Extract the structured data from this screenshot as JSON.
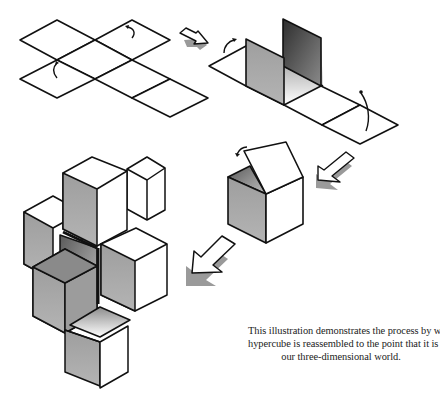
{
  "figure": {
    "stages": [
      {
        "id": "flat-net",
        "label": "Flat net of squares with fold arrows"
      },
      {
        "id": "partially-folded-net",
        "label": "Net with two faces raised"
      },
      {
        "id": "folding-cube",
        "label": "Cube with lid folding closed"
      },
      {
        "id": "assembled-hypercube",
        "label": "Hypercube net of cubes assembled in 3D"
      }
    ],
    "arrows": [
      {
        "from": "flat-net",
        "to": "partially-folded-net",
        "direction": "right-down"
      },
      {
        "from": "partially-folded-net",
        "to": "folding-cube",
        "direction": "left-down"
      },
      {
        "from": "folding-cube",
        "to": "assembled-hypercube",
        "direction": "left-down"
      }
    ],
    "colors": {
      "line": "#111111",
      "face_light": "#ffffff",
      "face_mid": "#a9a9a9",
      "face_dark": "#4a4a4a",
      "arrow_shadow": "#9a9a9a"
    }
  },
  "caption": {
    "lines": [
      "This illustration demonstrates the process by which an unraveled",
      "hypercube is reassembled to the point that it is still visible to",
      "our three-dimensional world."
    ]
  }
}
